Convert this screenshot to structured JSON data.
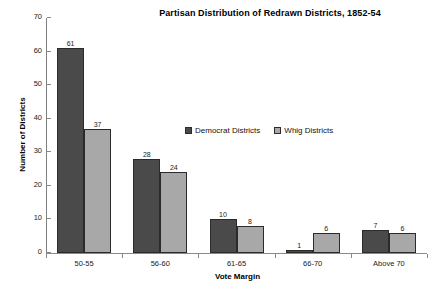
{
  "chart_data": {
    "type": "bar",
    "title": "Partisan Distribution of Redrawn Districts, 1852-54",
    "xlabel": "Vote Margin",
    "ylabel": "Number of Districts",
    "categories": [
      "50-55",
      "56-60",
      "61-65",
      "66-70",
      "Above 70"
    ],
    "series": [
      {
        "name": "Democrat Districts",
        "color": "#4a4a4a",
        "values": [
          61,
          28,
          10,
          1,
          7
        ]
      },
      {
        "name": "Whig Districts",
        "color": "#a8a8a8",
        "values": [
          37,
          24,
          8,
          6,
          6
        ]
      }
    ],
    "ylim": [
      0,
      70
    ],
    "yticks": [
      0,
      10,
      20,
      30,
      40,
      50,
      60,
      70
    ],
    "ytick_labels": [
      "0",
      "10",
      "20",
      "30",
      "40",
      "50",
      "60",
      "70"
    ],
    "grid": false,
    "legend_position": "inside-upper-center",
    "data_labels": true
  }
}
